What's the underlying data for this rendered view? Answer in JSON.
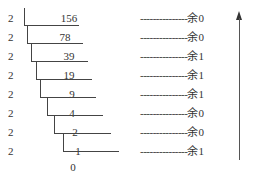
{
  "ladder": {
    "divisor": "2",
    "rows": [
      {
        "divisor": "2",
        "quotient": "156",
        "remainder_dashes": "---------------",
        "remainder": "余0"
      },
      {
        "divisor": "2",
        "quotient": "78",
        "remainder_dashes": "---------------",
        "remainder": "余0"
      },
      {
        "divisor": "2",
        "quotient": "39",
        "remainder_dashes": "---------------",
        "remainder": "余1"
      },
      {
        "divisor": "2",
        "quotient": "19",
        "remainder_dashes": "---------------",
        "remainder": "余1"
      },
      {
        "divisor": "2",
        "quotient": "9",
        "remainder_dashes": "---------------",
        "remainder": "余1"
      },
      {
        "divisor": "2",
        "quotient": "4",
        "remainder_dashes": "---------------",
        "remainder": "余0"
      },
      {
        "divisor": "2",
        "quotient": "2",
        "remainder_dashes": "---------------",
        "remainder": "余0"
      },
      {
        "divisor": "2",
        "quotient": "1",
        "remainder_dashes": "---------------",
        "remainder": "余1"
      }
    ],
    "final_quotient": "0"
  },
  "arrow": {
    "direction": "up",
    "meaning": "read remainders bottom to top"
  }
}
